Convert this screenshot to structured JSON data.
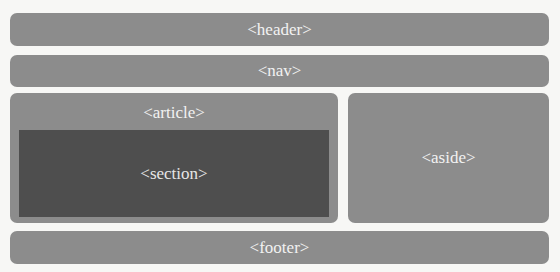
{
  "diagram": {
    "header": {
      "label": "<header>"
    },
    "nav": {
      "label": "<nav>"
    },
    "article": {
      "label": "<article>",
      "section": {
        "label": "<section>"
      }
    },
    "aside": {
      "label": "<aside>"
    },
    "footer": {
      "label": "<footer>"
    }
  },
  "colors": {
    "background": "#f7f7f5",
    "block": "#8c8c8c",
    "section": "#4e4e4e",
    "text": "#f2f2f2"
  }
}
